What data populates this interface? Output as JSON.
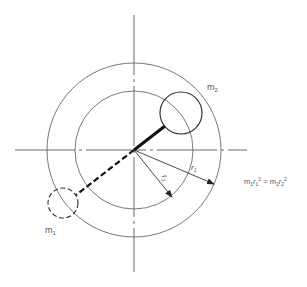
{
  "diagram": {
    "labels": {
      "mass_2": "m",
      "mass_2_sub": "2",
      "mass_1": "m",
      "mass_1_sub": "1",
      "radius_1": "r",
      "radius_1_sub": "1",
      "radius_2": "r",
      "radius_2_sub": "2",
      "equation_lhs_m": "m",
      "equation_lhs_m_sub": "1",
      "equation_lhs_r": "r",
      "equation_lhs_r_sub": "1",
      "equation_lhs_exp": "2",
      "equation_eq": " = ",
      "equation_rhs_m": "m",
      "equation_rhs_m_sub": "2",
      "equation_rhs_r": "r",
      "equation_rhs_r_sub": "2",
      "equation_rhs_exp": "2"
    },
    "colors": {
      "line": "#333333",
      "text": "#555555",
      "background": "#ffffff"
    }
  }
}
